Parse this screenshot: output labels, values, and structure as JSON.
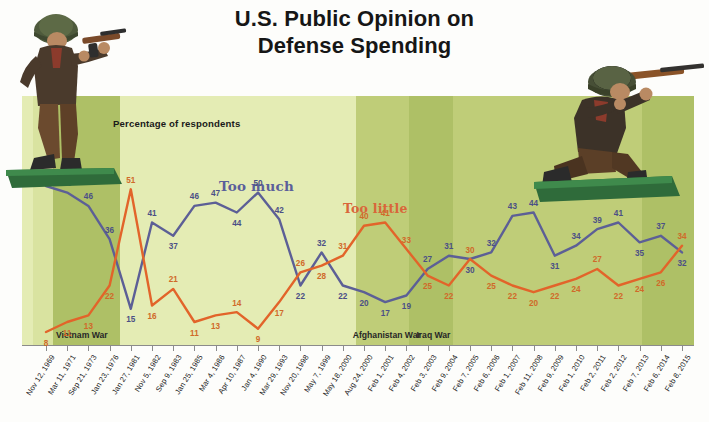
{
  "title_line1": "U.S. Public Opinion on",
  "title_line2": "Defense Spending",
  "axis_subtitle": "Percentage of respondents",
  "series_labels": {
    "too_much": "Too much",
    "too_little": "Too little"
  },
  "war_bands": [
    {
      "label": "Vietnam War",
      "start_index": 0,
      "end_index": 3
    },
    {
      "label": "Afghanistan War",
      "start_index": 14,
      "end_index": 17
    },
    {
      "label": "Iraq War",
      "start_index": 17,
      "end_index": 25
    }
  ],
  "colors": {
    "too_much": "#5c5f96",
    "too_little": "#e2642a",
    "panel": "#e4ecb4",
    "band_dark": "#aec066",
    "band_mid": "#bfcd78",
    "axis": "#8b8b8b",
    "title": "#161616"
  },
  "chart_data": {
    "type": "line",
    "title": "U.S. Public Opinion on Defense Spending",
    "xlabel": "",
    "ylabel": "Percentage of respondents",
    "ylim": [
      0,
      56
    ],
    "grid": false,
    "legend": "inline",
    "categories": [
      "Nov 12, 1969",
      "Mar 11, 1971",
      "Sep 21, 1973",
      "Jan 23, 1976",
      "Jan 27, 1981",
      "Nov 5, 1982",
      "Sep 9, 1983",
      "Jan 25, 1985",
      "Mar 4, 1986",
      "Apr 10, 1987",
      "Jan 4, 1990",
      "Mar 29, 1993",
      "Nov 20, 1998",
      "May 7, 1999",
      "May 18, 2000",
      "Aug 24, 2000",
      "Feb 1, 2001",
      "Feb 4, 2002",
      "Feb 3, 2003",
      "Feb 9, 2004",
      "Feb 7, 2005",
      "Feb 6, 2006",
      "Feb 1, 2007",
      "Feb 11, 2008",
      "Feb 9, 2009",
      "Feb 1, 2010",
      "Feb 2, 2011",
      "Feb 2, 2012",
      "Feb 7, 2013",
      "Feb 6, 2014",
      "Feb 8, 2015"
    ],
    "series": [
      {
        "name": "Too much",
        "color": "#5c5f96",
        "values": [
          52,
          50,
          46,
          36,
          15,
          41,
          37,
          46,
          47,
          44,
          50,
          42,
          22,
          32,
          22,
          20,
          17,
          19,
          27,
          31,
          30,
          32,
          43,
          44,
          31,
          34,
          39,
          41,
          35,
          37,
          32
        ]
      },
      {
        "name": "Too little",
        "color": "#e2642a",
        "values": [
          8,
          11,
          13,
          22,
          51,
          16,
          21,
          11,
          13,
          14,
          9,
          17,
          26,
          28,
          31,
          40,
          41,
          33,
          25,
          22,
          30,
          25,
          22,
          20,
          22,
          24,
          27,
          22,
          24,
          26,
          34
        ]
      }
    ]
  }
}
